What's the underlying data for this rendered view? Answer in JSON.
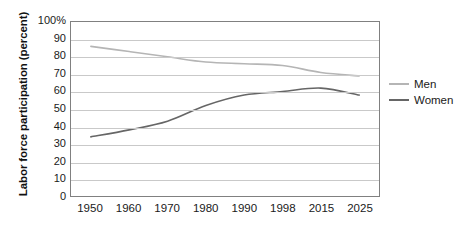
{
  "chart_data": {
    "type": "line",
    "title": "",
    "xlabel": "",
    "ylabel": "Labor force participation (percent)",
    "categories": [
      "1950",
      "1960",
      "1970",
      "1980",
      "1990",
      "1998",
      "2015",
      "2025"
    ],
    "ylim": [
      0,
      100
    ],
    "yticks": [
      0,
      10,
      20,
      30,
      40,
      50,
      60,
      70,
      80,
      90,
      100
    ],
    "ytick_labels": [
      "0",
      "10",
      "20",
      "30",
      "40",
      "50",
      "60",
      "70",
      "80",
      "90",
      "100%"
    ],
    "grid": true,
    "legend_position": "right",
    "series": [
      {
        "name": "Men",
        "color": "#b5b5b5",
        "values": [
          86,
          83,
          80,
          77,
          76,
          75,
          71,
          69
        ]
      },
      {
        "name": "Women",
        "color": "#666666",
        "values": [
          34,
          38,
          43,
          52,
          58,
          60,
          62,
          58
        ]
      }
    ]
  },
  "axis": {
    "y_title": "Labor force participation (percent)"
  },
  "legend": {
    "items": [
      {
        "label": "Men"
      },
      {
        "label": "Women"
      }
    ]
  },
  "colors": {
    "men_line": "#b5b5b5",
    "women_line": "#666666",
    "gridline": "#c9c9c9",
    "frame": "#808080",
    "text": "#1a1a1a",
    "background": "#ffffff"
  }
}
